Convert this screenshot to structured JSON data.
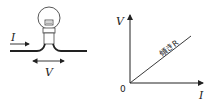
{
  "circuit": {
    "current_label": "I",
    "voltage_label": "V",
    "component": "light-bulb"
  },
  "graph": {
    "y_axis_label": "V",
    "x_axis_label": "I",
    "origin_label": "0",
    "line_label": "傾きR"
  },
  "colors": {
    "stroke": "#222222",
    "background": "#ffffff"
  }
}
